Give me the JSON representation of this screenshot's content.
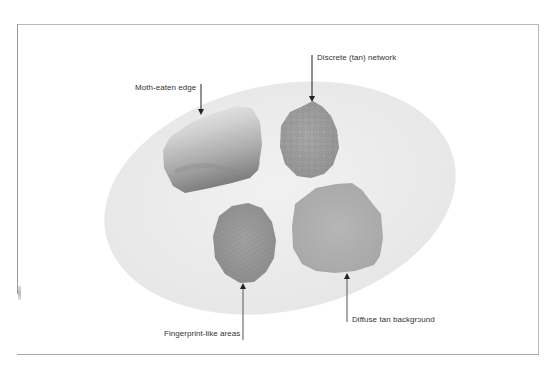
{
  "figure": {
    "colors": {
      "frame": "#b8b8b8",
      "ellipse_fill": "#ececec",
      "arrow": "#222222",
      "label_text": "#333333"
    },
    "lesions": [
      {
        "id": "moth-eaten",
        "description": "irregular lesion, pale top, dark lower edge"
      },
      {
        "id": "discrete-network",
        "description": "small lesion with reticular pattern"
      },
      {
        "id": "fingerprint",
        "description": "oval lesion with fingerprint-like texture"
      },
      {
        "id": "diffuse-tan",
        "description": "large round lesion, uniform tan"
      }
    ],
    "labels": {
      "moth_eaten_edge": "Moth-eaten edge",
      "discrete_network": "Discrete (tan) network",
      "fingerprint_like": "Fingerprint-like areas",
      "diffuse_tan": "Diffuse tan backgrɔund"
    }
  }
}
